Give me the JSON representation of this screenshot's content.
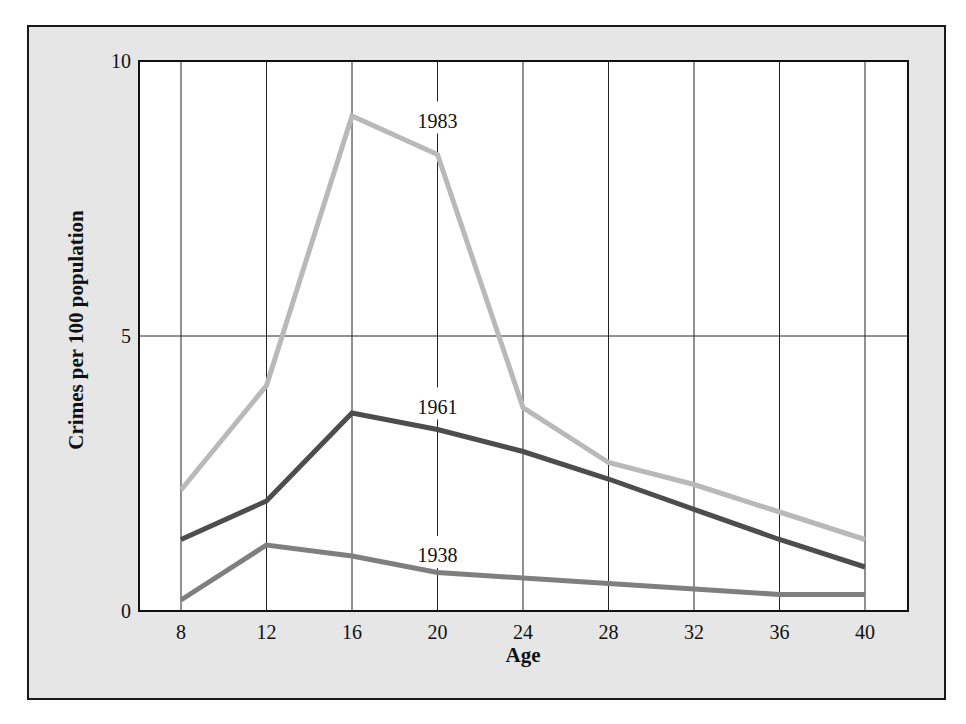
{
  "chart_data": {
    "type": "line",
    "title": "",
    "xlabel": "Age",
    "ylabel": "Crimes per 100 population",
    "x": [
      8,
      12,
      16,
      20,
      24,
      28,
      32,
      36,
      40
    ],
    "xticks": [
      "8",
      "12",
      "16",
      "20",
      "24",
      "28",
      "32",
      "36",
      "40"
    ],
    "yticks": [
      "0",
      "5",
      "10"
    ],
    "ylim": [
      0,
      10
    ],
    "xlim": [
      5,
      44.3
    ],
    "grid": {
      "vertical": true,
      "horizontal_at": [
        5
      ]
    },
    "legend": "inline labels",
    "series": [
      {
        "name": "1983",
        "color": "#b9b9b9",
        "values": [
          2.2,
          4.1,
          9.0,
          8.3,
          3.7,
          2.7,
          2.3,
          1.8,
          1.3
        ],
        "label_pos": {
          "x": 20,
          "y": 8.9
        }
      },
      {
        "name": "1961",
        "color": "#4d4d4d",
        "values": [
          1.3,
          2.0,
          3.6,
          3.3,
          2.9,
          2.4,
          1.85,
          1.3,
          0.8
        ],
        "label_pos": {
          "x": 20,
          "y": 3.7
        }
      },
      {
        "name": "1938",
        "color": "#7f7f7f",
        "values": [
          0.2,
          1.2,
          1.0,
          0.7,
          0.6,
          0.5,
          0.4,
          0.3,
          0.3
        ],
        "label_pos": {
          "x": 20,
          "y": 1.0
        }
      }
    ]
  }
}
